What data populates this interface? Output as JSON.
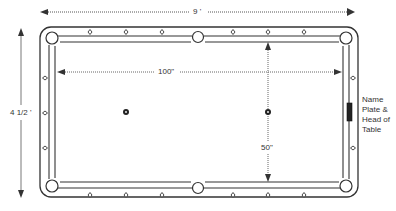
{
  "diagram": {
    "dimensions": {
      "table_length_label": "9 '",
      "table_width_label": "4 1/2 '",
      "playing_length_label": "100\"",
      "playing_width_label": "50\""
    },
    "head_note": {
      "lines": [
        "Name",
        "Plate &",
        "Head of",
        "Table"
      ]
    },
    "pockets": [
      "top-left-corner",
      "top-side",
      "top-right-corner",
      "bottom-left-corner",
      "bottom-side",
      "bottom-right-corner"
    ],
    "diamonds_per_long_rail": 6,
    "diamonds_per_short_rail": 3,
    "spots": [
      "head-spot",
      "foot-spot"
    ],
    "colors": {
      "line": "#333333",
      "background": "#ffffff",
      "name_plate": "#222222"
    }
  }
}
